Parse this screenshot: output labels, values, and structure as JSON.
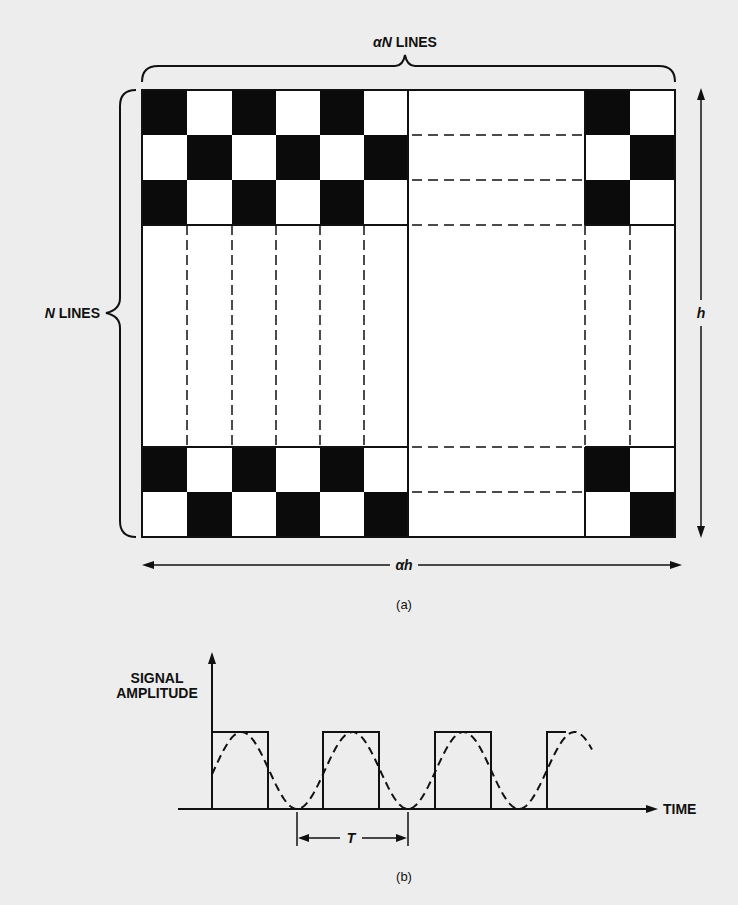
{
  "figure_a": {
    "top_label_symbol": "αN",
    "top_label_text": " LINES",
    "left_label_symbol": "N",
    "left_label_text": " LINES",
    "height_label": "h",
    "width_label": "αh",
    "caption": "(a)",
    "pattern": {
      "description": "checkerboard test pattern, alternating black/white line elements",
      "top_rows": [
        [
          "black",
          "white",
          "black",
          "white",
          "black",
          "white",
          "gap",
          "black",
          "white"
        ],
        [
          "white",
          "black",
          "white",
          "black",
          "white",
          "black",
          "gap",
          "white",
          "black"
        ],
        [
          "black",
          "white",
          "black",
          "white",
          "black",
          "white",
          "gap",
          "black",
          "white"
        ]
      ],
      "bottom_rows": [
        [
          "black",
          "white",
          "black",
          "white",
          "black",
          "white",
          "gap",
          "black",
          "white"
        ],
        [
          "white",
          "black",
          "white",
          "black",
          "white",
          "black",
          "gap",
          "white",
          "black"
        ]
      ]
    },
    "colors": {
      "black": "#0b0b0b",
      "white": "#ffffff",
      "line": "#111111"
    }
  },
  "figure_b": {
    "y_axis_label_line1": "SIGNAL",
    "y_axis_label_line2": "AMPLITUDE",
    "x_axis_label": "TIME",
    "period_label": "T",
    "caption": "(b)",
    "square_wave_pulses": 4,
    "sine_wave": "dashed",
    "square_wave": "solid"
  }
}
